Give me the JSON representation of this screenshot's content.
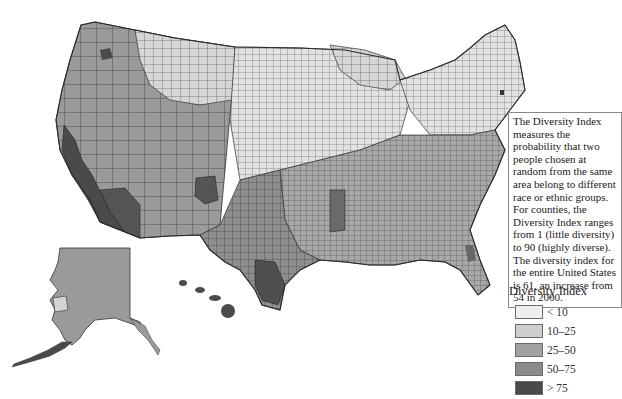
{
  "map": {
    "title": "",
    "subject": "Diversity Index by U.S. county",
    "regions_shown": [
      "Contiguous United States",
      "Alaska",
      "Hawaii"
    ]
  },
  "info_box": {
    "text": "The Diversity Index measures the probability that two people chosen at random from the same area belong to different race or ethnic groups. For counties, the Diversity Index ranges from 1 (little diversity) to 90 (highly diverse). The diversity index for the entire United States is 61, an increase from 54 in 2000."
  },
  "legend": {
    "title": "Diversity Index",
    "items": [
      {
        "label": "< 10",
        "color": "#efefef"
      },
      {
        "label": "10–25",
        "color": "#cfcfcf"
      },
      {
        "label": "25–50",
        "color": "#a2a2a2"
      },
      {
        "label": "50–75",
        "color": "#8a8a8a"
      },
      {
        "label": "> 75",
        "color": "#4a4a4a"
      }
    ]
  },
  "colors": {
    "border": "#3a3a3a",
    "background": "#ffffff"
  }
}
